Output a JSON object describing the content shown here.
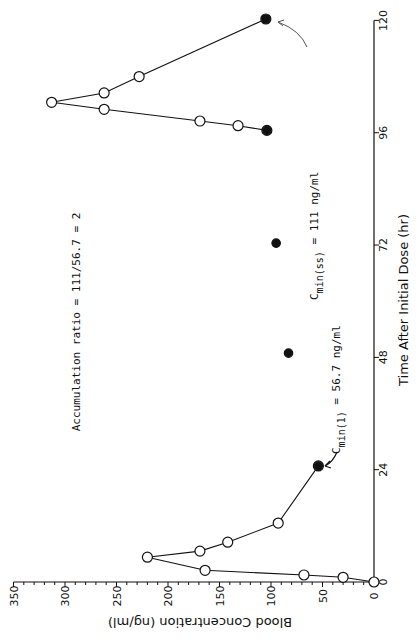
{
  "chart_data": {
    "type": "line",
    "title": "",
    "xlabel": "Time After Initial Dose (hr)",
    "ylabel": "Blood Concentration (ng/ml)",
    "orientation": "rotated 90 degrees clockwise (time axis vertical on right, concentration axis horizontal at bottom)",
    "xlim": [
      0,
      120
    ],
    "ylim": [
      0,
      350
    ],
    "x_ticks": [
      0,
      24,
      48,
      72,
      96,
      120
    ],
    "y_ticks": [
      0,
      50,
      100,
      150,
      200,
      250,
      300,
      350
    ],
    "grid": false,
    "series": [
      {
        "name": "First dose (open circles)",
        "marker": "open-circle",
        "connected": true,
        "x": [
          0,
          1,
          1.5,
          2.5,
          5.3,
          6.6,
          8.5,
          12.6,
          24.8
        ],
        "y": [
          0,
          30,
          68,
          164,
          220,
          169,
          142,
          93,
          54
        ]
      },
      {
        "name": "Last dose (open circles)",
        "marker": "open-circle",
        "connected": true,
        "x": [
          96.5,
          97.5,
          98.5,
          101,
          102.5,
          104.5,
          108,
          120.3
        ],
        "y": [
          104,
          132,
          169,
          262,
          313,
          262,
          228,
          105
        ]
      },
      {
        "name": "Trough levels (filled circles)",
        "marker": "filled-circle",
        "connected": false,
        "x": [
          24.8,
          48.9,
          72.4,
          96.5,
          120.3
        ],
        "y": [
          54,
          83,
          95,
          104,
          105
        ]
      }
    ],
    "annotations": [
      {
        "text_main": "C",
        "text_sub": "min(1)",
        "text_rest": " = 56.7 ng/ml",
        "points_to": [
          24.8,
          54
        ]
      },
      {
        "text_main": "C",
        "text_sub": "min(ss)",
        "text_rest": " = 111 ng/ml",
        "points_to": [
          120.3,
          105
        ]
      },
      {
        "text": "Accumulation ratio = 111/56.7 = 2"
      }
    ]
  },
  "labels": {
    "xlabel": "Time After Initial Dose (hr)",
    "ylabel": "Blood Concentration (ng/ml)",
    "x_ticks": [
      "0",
      "24",
      "48",
      "72",
      "96",
      "120"
    ],
    "y_ticks": [
      "0",
      "50",
      "100",
      "150",
      "200",
      "250",
      "300",
      "350"
    ],
    "cmin1_main": "C",
    "cmin1_sub": "min(1)",
    "cmin1_rest": " = 56.7 ng/ml",
    "cminss_main": "C",
    "cminss_sub": "min(ss)",
    "cminss_rest": " = 111 ng/ml",
    "ratio": "Accumulation ratio = 111/56.7 = 2"
  },
  "colors": {
    "ink": "#111111",
    "background": "#ffffff"
  }
}
